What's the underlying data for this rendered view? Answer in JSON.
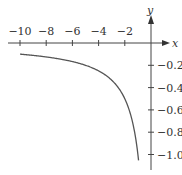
{
  "chart_data": {
    "type": "line",
    "title": "",
    "function": "y = 1/x",
    "xlabel": "x",
    "ylabel": "y",
    "x_ticks": [
      -10,
      -8,
      -6,
      -4,
      -2
    ],
    "x_tick_labels": [
      "−10",
      "−8",
      "−6",
      "−4",
      "−2"
    ],
    "y_ticks": [
      -0.2,
      -0.4,
      -0.6,
      -0.8,
      -1.0
    ],
    "y_tick_labels": [
      "−0.2",
      "−0.4",
      "−0.6",
      "−0.8",
      "−1.0"
    ],
    "xlim": [
      -10,
      0
    ],
    "ylim": [
      -1.1,
      0
    ],
    "grid": false,
    "series": [
      {
        "name": "1/x",
        "x": [
          -10,
          -8,
          -6,
          -5,
          -4,
          -3,
          -2.5,
          -2,
          -1.5,
          -1.25,
          -1,
          -0.9
        ],
        "y": [
          -0.1,
          -0.125,
          -0.167,
          -0.2,
          -0.25,
          -0.333,
          -0.4,
          -0.5,
          -0.667,
          -0.8,
          -1.0,
          -1.111
        ]
      }
    ]
  },
  "axes": {
    "x_label": "x",
    "y_label": "y"
  }
}
